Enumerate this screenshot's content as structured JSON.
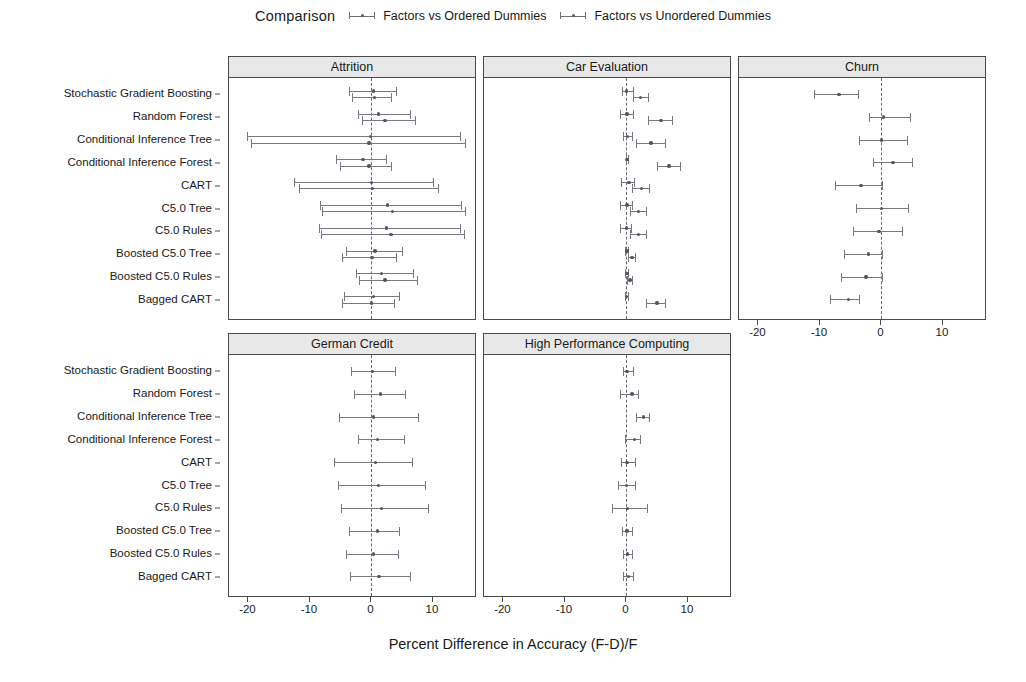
{
  "legend": {
    "title": "Comparison",
    "entries": [
      {
        "label": "Factors vs Ordered Dummies",
        "color": "#6f6f77"
      },
      {
        "label": "Factors vs Unordered Dummies",
        "color": "#6f6f77"
      }
    ]
  },
  "axis": {
    "xlabel": "Percent Difference in Accuracy (F-D)/F",
    "xticks": [
      "-20",
      "-10",
      "0",
      "10"
    ],
    "xtickvals": [
      -20,
      -10,
      0,
      10
    ],
    "xlim": [
      -23,
      17
    ],
    "grid": false
  },
  "models": [
    "Stochastic Gradient Boosting",
    "Random Forest",
    "Conditional Inference Tree",
    "Conditional Inference Forest",
    "CART",
    "C5.0 Tree",
    "C5.0 Rules",
    "Boosted C5.0 Tree",
    "Boosted C5.0 Rules",
    "Bagged CART"
  ],
  "chart_data": {
    "type": "scatter",
    "title": "Percent Difference in Accuracy (F-D)/F",
    "xlabel": "Percent Difference in Accuracy (F-D)/F",
    "ylabel": "",
    "xlim": [
      -23,
      17
    ],
    "xticks": [
      -20,
      -10,
      0,
      10
    ],
    "grid": false,
    "legend_position": "top",
    "categories": [
      "Stochastic Gradient Boosting",
      "Random Forest",
      "Conditional Inference Tree",
      "Conditional Inference Forest",
      "CART",
      "C5.0 Tree",
      "C5.0 Rules",
      "Boosted C5.0 Tree",
      "Boosted C5.0 Rules",
      "Bagged CART"
    ],
    "series_names": [
      "Factors vs Ordered Dummies",
      "Factors vs Unordered Dummies"
    ],
    "panels": [
      {
        "name": "Attrition",
        "row": 0,
        "col": 0,
        "series": [
          {
            "name": "Factors vs Ordered Dummies",
            "points": [
              {
                "category": "Stochastic Gradient Boosting",
                "mean": 0.3,
                "lower": -3.6,
                "upper": 4.1
              },
              {
                "category": "Random Forest",
                "mean": 1.1,
                "lower": -2.2,
                "upper": 6.4
              },
              {
                "category": "Conditional Inference Tree",
                "mean": -0.2,
                "lower": -20.3,
                "upper": 14.6
              },
              {
                "category": "Conditional Inference Forest",
                "mean": -1.4,
                "lower": -5.8,
                "upper": 2.5
              },
              {
                "category": "CART",
                "mean": 0.0,
                "lower": -12.6,
                "upper": 10.2
              },
              {
                "category": "C5.0 Tree",
                "mean": 2.6,
                "lower": -8.4,
                "upper": 14.8
              },
              {
                "category": "C5.0 Rules",
                "mean": 2.4,
                "lower": -8.6,
                "upper": 14.6
              },
              {
                "category": "Boosted C5.0 Tree",
                "mean": 0.6,
                "lower": -4.2,
                "upper": 5.1
              },
              {
                "category": "Boosted C5.0 Rules",
                "mean": 1.6,
                "lower": -2.5,
                "upper": 6.9
              },
              {
                "category": "Bagged CART",
                "mean": 0.3,
                "lower": -4.4,
                "upper": 4.6
              }
            ]
          },
          {
            "name": "Factors vs Unordered Dummies",
            "points": [
              {
                "category": "Stochastic Gradient Boosting",
                "mean": 0.5,
                "lower": -3.1,
                "upper": 3.3
              },
              {
                "category": "Random Forest",
                "mean": 2.2,
                "lower": -1.6,
                "upper": 7.2
              },
              {
                "category": "Conditional Inference Tree",
                "mean": -0.4,
                "lower": -19.6,
                "upper": 15.3
              },
              {
                "category": "Conditional Inference Forest",
                "mean": -0.4,
                "lower": -5.1,
                "upper": 3.4
              },
              {
                "category": "CART",
                "mean": 0.2,
                "lower": -11.8,
                "upper": 11.0
              },
              {
                "category": "C5.0 Tree",
                "mean": 3.4,
                "lower": -8.0,
                "upper": 15.4
              },
              {
                "category": "C5.0 Rules",
                "mean": 3.2,
                "lower": -8.2,
                "upper": 15.2
              },
              {
                "category": "Boosted C5.0 Tree",
                "mean": 0.1,
                "lower": -4.8,
                "upper": 4.2
              },
              {
                "category": "Boosted C5.0 Rules",
                "mean": 2.2,
                "lower": -2.0,
                "upper": 7.6
              },
              {
                "category": "Bagged CART",
                "mean": 0.0,
                "lower": -4.8,
                "upper": 3.9
              }
            ]
          }
        ]
      },
      {
        "name": "Car Evaluation",
        "row": 0,
        "col": 1,
        "series": [
          {
            "name": "Factors vs Ordered Dummies",
            "points": [
              {
                "category": "Stochastic Gradient Boosting",
                "mean": 0.0,
                "lower": -0.8,
                "upper": 1.2
              },
              {
                "category": "Random Forest",
                "mean": 0.1,
                "lower": -1.0,
                "upper": 1.3
              },
              {
                "category": "Conditional Inference Tree",
                "mean": 0.2,
                "lower": -0.5,
                "upper": 1.0
              },
              {
                "category": "Conditional Inference Forest",
                "mean": 0.1,
                "lower": -0.1,
                "upper": 0.4
              },
              {
                "category": "CART",
                "mean": 0.4,
                "lower": -0.9,
                "upper": 1.4
              },
              {
                "category": "C5.0 Tree",
                "mean": 0.1,
                "lower": -1.1,
                "upper": 1.0
              },
              {
                "category": "C5.0 Rules",
                "mean": 0.0,
                "lower": -1.1,
                "upper": 0.9
              },
              {
                "category": "Boosted C5.0 Tree",
                "mean": 0.1,
                "lower": -0.3,
                "upper": 0.4
              },
              {
                "category": "Boosted C5.0 Rules",
                "mean": 0.1,
                "lower": -0.2,
                "upper": 0.4
              },
              {
                "category": "Bagged CART",
                "mean": 0.0,
                "lower": -0.3,
                "upper": 0.4
              }
            ]
          },
          {
            "name": "Factors vs Unordered Dummies",
            "points": [
              {
                "category": "Stochastic Gradient Boosting",
                "mean": 2.3,
                "lower": 1.1,
                "upper": 3.6
              },
              {
                "category": "Random Forest",
                "mean": 5.6,
                "lower": 3.5,
                "upper": 7.6
              },
              {
                "category": "Conditional Inference Tree",
                "mean": 4.0,
                "lower": 1.6,
                "upper": 6.4
              },
              {
                "category": "Conditional Inference Forest",
                "mean": 6.9,
                "lower": 4.9,
                "upper": 8.8
              },
              {
                "category": "CART",
                "mean": 2.4,
                "lower": 0.9,
                "upper": 3.9
              },
              {
                "category": "C5.0 Tree",
                "mean": 2.0,
                "lower": 0.6,
                "upper": 3.4
              },
              {
                "category": "C5.0 Rules",
                "mean": 2.0,
                "lower": 0.6,
                "upper": 3.4
              },
              {
                "category": "Boosted C5.0 Tree",
                "mean": 0.9,
                "lower": 0.2,
                "upper": 1.6
              },
              {
                "category": "Boosted C5.0 Rules",
                "mean": 0.6,
                "lower": 0.1,
                "upper": 1.1
              },
              {
                "category": "Bagged CART",
                "mean": 5.0,
                "lower": 3.1,
                "upper": 6.4
              }
            ]
          }
        ]
      },
      {
        "name": "Churn",
        "row": 0,
        "col": 2,
        "series": [
          {
            "name": "Factors vs Ordered Dummies",
            "points": [
              {
                "category": "Stochastic Gradient Boosting",
                "mean": -6.9,
                "lower": -10.9,
                "upper": -3.6
              },
              {
                "category": "Random Forest",
                "mean": 0.3,
                "lower": -2.1,
                "upper": 4.8
              },
              {
                "category": "Conditional Inference Tree",
                "mean": 0.0,
                "lower": -3.6,
                "upper": 4.4
              },
              {
                "category": "Conditional Inference Forest",
                "mean": 1.9,
                "lower": -1.4,
                "upper": 5.2
              },
              {
                "category": "CART",
                "mean": -3.3,
                "lower": -7.5,
                "upper": 0.2
              },
              {
                "category": "C5.0 Tree",
                "mean": 0.0,
                "lower": -4.1,
                "upper": 4.4
              },
              {
                "category": "C5.0 Rules",
                "mean": -0.4,
                "lower": -4.7,
                "upper": 3.5
              },
              {
                "category": "Boosted C5.0 Tree",
                "mean": -2.1,
                "lower": -6.1,
                "upper": 0.2
              },
              {
                "category": "Boosted C5.0 Rules",
                "mean": -2.5,
                "lower": -6.5,
                "upper": 0.2
              },
              {
                "category": "Bagged CART",
                "mean": -5.4,
                "lower": -8.3,
                "upper": -3.5
              }
            ]
          }
        ]
      },
      {
        "name": "German Credit",
        "row": 1,
        "col": 0,
        "series": [
          {
            "name": "Factors vs Ordered Dummies",
            "points": [
              {
                "category": "Stochastic Gradient Boosting",
                "mean": 0.2,
                "lower": -3.4,
                "upper": 4.0
              },
              {
                "category": "Random Forest",
                "mean": 1.5,
                "lower": -2.9,
                "upper": 5.7
              },
              {
                "category": "Conditional Inference Tree",
                "mean": 0.3,
                "lower": -5.3,
                "upper": 7.8
              },
              {
                "category": "Conditional Inference Forest",
                "mean": 1.0,
                "lower": -2.2,
                "upper": 5.4
              },
              {
                "category": "CART",
                "mean": 0.7,
                "lower": -6.1,
                "upper": 6.7
              },
              {
                "category": "C5.0 Tree",
                "mean": 1.1,
                "lower": -5.4,
                "upper": 8.8
              },
              {
                "category": "C5.0 Rules",
                "mean": 1.6,
                "lower": -5.0,
                "upper": 9.4
              },
              {
                "category": "Boosted C5.0 Tree",
                "mean": 1.0,
                "lower": -3.6,
                "upper": 4.6
              },
              {
                "category": "Boosted C5.0 Rules",
                "mean": 0.3,
                "lower": -4.1,
                "upper": 4.5
              },
              {
                "category": "Bagged CART",
                "mean": 1.2,
                "lower": -3.5,
                "upper": 6.5
              }
            ]
          }
        ]
      },
      {
        "name": "High Performance Computing",
        "row": 1,
        "col": 1,
        "series": [
          {
            "name": "Factors vs Ordered Dummies",
            "points": [
              {
                "category": "Stochastic Gradient Boosting",
                "mean": 0.1,
                "lower": -0.6,
                "upper": 1.2
              },
              {
                "category": "Random Forest",
                "mean": 0.9,
                "lower": -1.0,
                "upper": 2.1
              },
              {
                "category": "Conditional Inference Tree",
                "mean": 2.8,
                "lower": 1.5,
                "upper": 3.9
              },
              {
                "category": "Conditional Inference Forest",
                "mean": 1.3,
                "lower": -0.3,
                "upper": 2.3
              },
              {
                "category": "CART",
                "mean": 0.1,
                "lower": -0.9,
                "upper": 1.6
              },
              {
                "category": "C5.0 Tree",
                "mean": 0.0,
                "lower": -1.4,
                "upper": 1.5
              },
              {
                "category": "C5.0 Rules",
                "mean": 0.2,
                "lower": -2.4,
                "upper": 3.5
              },
              {
                "category": "Boosted C5.0 Tree",
                "mean": 0.1,
                "lower": -0.7,
                "upper": 1.1
              },
              {
                "category": "Boosted C5.0 Rules",
                "mean": 0.2,
                "lower": -0.5,
                "upper": 1.0
              },
              {
                "category": "Bagged CART",
                "mean": 0.3,
                "lower": -0.5,
                "upper": 1.2
              }
            ]
          }
        ]
      }
    ]
  }
}
